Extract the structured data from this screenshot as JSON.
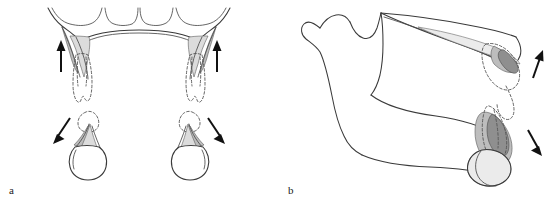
{
  "figure": {
    "kind": "anatomical-line-diagram",
    "background_color": "#ffffff",
    "width": 556,
    "height": 201,
    "panels": [
      {
        "id": "a",
        "label": "a",
        "label_position": "bottom-left",
        "view": "occlusal / coronal view of maxilla and mandible arches",
        "structures": [
          {
            "name": "maxillary-arch",
            "description": "Maxillary dental arch with alveolar notches and bilateral tuberosities"
          },
          {
            "name": "maxillary-tuberosity-left",
            "description": "Shaded wedge of bone at left maxillary tuberosity"
          },
          {
            "name": "maxillary-tuberosity-right",
            "description": "Shaded wedge of bone at right maxillary tuberosity"
          },
          {
            "name": "impacted-maxillary-third-molar-left",
            "description": "Dashed outline of displaced upper left third molar"
          },
          {
            "name": "impacted-maxillary-third-molar-right",
            "description": "Dashed outline of displaced upper right third molar"
          },
          {
            "name": "mandibular-third-molar-left",
            "description": "Lower left third molar crown with dashed displaced root"
          },
          {
            "name": "mandibular-third-molar-right",
            "description": "Lower right third molar crown with dashed displaced root"
          }
        ],
        "arrows": [
          {
            "id": "arrow-a-upper-left",
            "direction": "up",
            "meaning": "superior displacement of upper left third molar"
          },
          {
            "id": "arrow-a-upper-right",
            "direction": "up",
            "meaning": "superior displacement of upper right third molar"
          },
          {
            "id": "arrow-a-lower-left",
            "direction": "down-left",
            "meaning": "inferolateral displacement of lower left third molar"
          },
          {
            "id": "arrow-a-lower-right",
            "direction": "down-right",
            "meaning": "inferolateral displacement of lower right third molar"
          }
        ]
      },
      {
        "id": "b",
        "label": "b",
        "label_position": "bottom-left",
        "view": "lateral / sagittal view of maxilla and mandible",
        "structures": [
          {
            "name": "mandibular-ramus",
            "description": "Ramus of the mandible"
          },
          {
            "name": "coronoid-process",
            "description": "Coronoid process"
          },
          {
            "name": "mandibular-condyle",
            "description": "Condylar process"
          },
          {
            "name": "sigmoid-notch",
            "description": "Mandibular (sigmoid) notch between coronoid and condyle"
          },
          {
            "name": "mandibular-body",
            "description": "Body of the mandible"
          },
          {
            "name": "maxilla-lateral",
            "description": "Maxilla seen from lateral aspect with posterior tuberosity"
          },
          {
            "name": "maxillary-tuberosity",
            "description": "Shaded maxillary tuberosity region"
          },
          {
            "name": "impacted-maxillary-third-molar",
            "description": "Dashed outline of displaced upper third molar"
          },
          {
            "name": "impacted-mandibular-third-molar",
            "description": "Lower third molar with shaded crown and dashed displaced outline"
          }
        ],
        "arrows": [
          {
            "id": "arrow-b-upper",
            "direction": "up-right",
            "meaning": "superoposterior displacement of upper third molar"
          },
          {
            "id": "arrow-b-lower",
            "direction": "down-right",
            "meaning": "inferoposterior displacement of lower third molar"
          }
        ]
      }
    ],
    "colors": {
      "outline": "#3a3a3a",
      "outline_light": "#4a4a4a",
      "dashed_outline": "#555555",
      "shade_dark": "#8f8f8f",
      "shade_mid": "#bdbdbd",
      "shade_light": "#dcdcdc",
      "shade_pale": "#ebebeb",
      "arrow": "#111111",
      "label_text": "#1a1a1a"
    }
  }
}
